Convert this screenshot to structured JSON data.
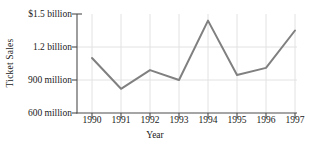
{
  "chart_data": {
    "type": "line",
    "title": "",
    "xlabel": "Year",
    "ylabel": "Ticket Sales",
    "categories": [
      "1990",
      "1991",
      "1992",
      "1993",
      "1994",
      "1995",
      "1996",
      "1997"
    ],
    "values": [
      1100,
      820,
      990,
      900,
      1440,
      945,
      1010,
      1350
    ],
    "value_units": "millions of dollars",
    "ylim": [
      600,
      1500
    ],
    "ytick_values": [
      1500,
      1200,
      900,
      600
    ],
    "ytick_labels": [
      "$1.5 billion",
      "1.2 billion",
      "900 million",
      "600 million"
    ],
    "xtick_labels": [
      "1990",
      "1991",
      "1992",
      "1993",
      "1994",
      "1995",
      "1996",
      "1997"
    ],
    "grid": true,
    "legend": "none",
    "series": [
      {
        "name": "Ticket Sales",
        "values": [
          1100,
          820,
          990,
          900,
          1440,
          945,
          1010,
          1350
        ],
        "color": "#808080"
      }
    ],
    "colors": {
      "line": "#808080",
      "axis": "#4d4d4d",
      "grid": "#e2e2e2",
      "text": "#1a1a1a",
      "background": "#ffffff"
    }
  }
}
